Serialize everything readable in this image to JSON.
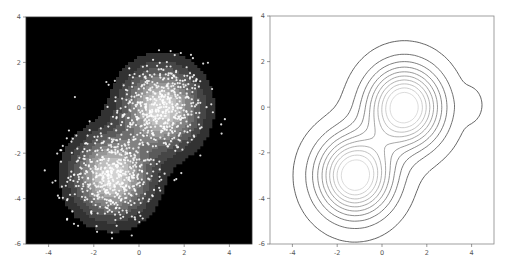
{
  "chart_data": [
    {
      "type": "heatmap",
      "subtype": "kde-shaded-with-scatter",
      "title": "",
      "xlabel": "",
      "ylabel": "",
      "xlim": [
        -5,
        5
      ],
      "ylim": [
        -6,
        4
      ],
      "xticks": [
        -4,
        -2,
        0,
        2,
        4
      ],
      "yticks": [
        4,
        2,
        0,
        -2,
        -4,
        -6
      ],
      "grid": false,
      "background": "#000000",
      "colormap": "gray (black to white)",
      "series": [
        {
          "name": "cluster-upper",
          "center": [
            1.0,
            0.0
          ],
          "std": [
            0.95,
            1.0
          ],
          "n": 500
        },
        {
          "name": "cluster-lower",
          "center": [
            -1.2,
            -3.0
          ],
          "std": [
            0.95,
            1.0
          ],
          "n": 500
        }
      ],
      "marker_color": "#ffffff",
      "notable_outliers": [
        [
          3.8,
          -0.5
        ],
        [
          -3.1,
          -1.0
        ],
        [
          1.4,
          2.5
        ],
        [
          -1.2,
          -5.5
        ]
      ]
    },
    {
      "type": "heatmap",
      "subtype": "kde-contour",
      "title": "",
      "xlabel": "",
      "ylabel": "",
      "xlim": [
        -5,
        5
      ],
      "ylim": [
        -6,
        4
      ],
      "xticks": [
        -4,
        -2,
        0,
        2,
        4
      ],
      "yticks": [
        4,
        2,
        0,
        -2,
        -4,
        -6
      ],
      "grid": false,
      "background": "#ffffff",
      "contour_levels": 10,
      "contour_colors": "outer dark gray to inner light gray",
      "peaks": [
        [
          1.0,
          0.0
        ],
        [
          -1.2,
          -2.9
        ]
      ]
    }
  ]
}
